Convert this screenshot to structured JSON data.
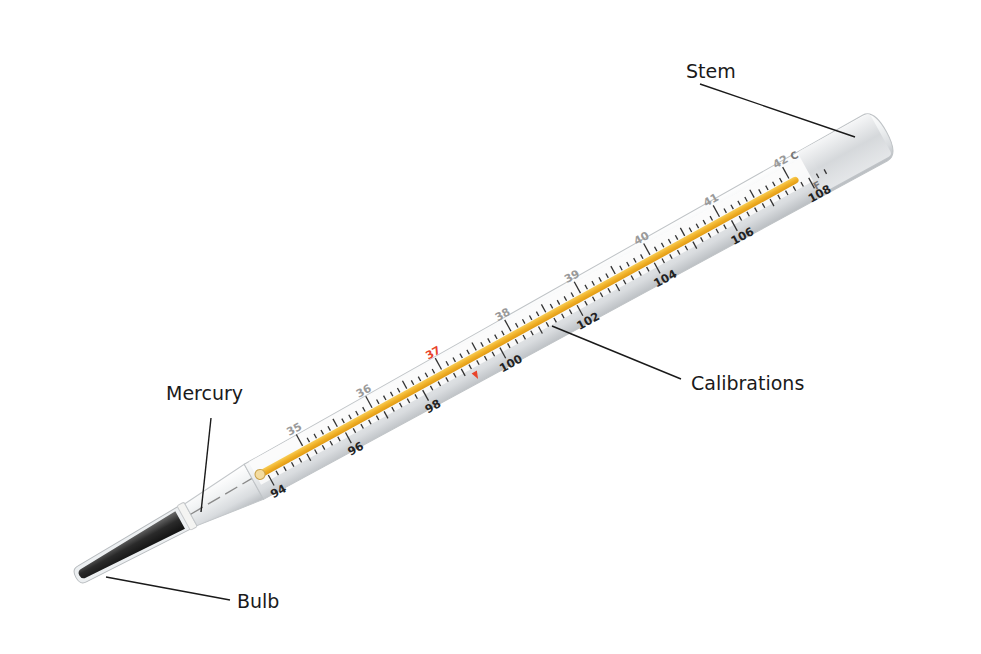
{
  "figure": {
    "labels": {
      "stem": "Stem",
      "calibrations": "Calibrations",
      "mercury": "Mercury",
      "bulb": "Bulb"
    },
    "scale": {
      "celsius_unit": "C",
      "fahrenheit_unit": "F",
      "celsius_ticks": [
        "3|5",
        "3|6",
        "3|7",
        "3|8",
        "3|9",
        "4|0",
        "4|1",
        "4|2"
      ],
      "celsius_highlight": "3|7",
      "fahrenheit_ticks": [
        "9|4",
        "9|6",
        "9|8",
        "1|00",
        "1|02",
        "1|04",
        "1|06",
        "1|08"
      ],
      "fahrenheit_display": [
        "94",
        "96",
        "98",
        "100",
        "102",
        "104",
        "106",
        "108"
      ],
      "celsius_display": [
        "35",
        "36",
        "37",
        "38",
        "39",
        "40",
        "41",
        "42"
      ]
    },
    "colors": {
      "mercury_column": "#f2b630",
      "bulb": "#2b2b2b",
      "glass": "#e9ecef",
      "highlight_37": "#e8442a",
      "celsius_text": "#9a9a9a",
      "fahrenheit_text": "#222222",
      "leader_lines": "#1a1a1a"
    }
  }
}
